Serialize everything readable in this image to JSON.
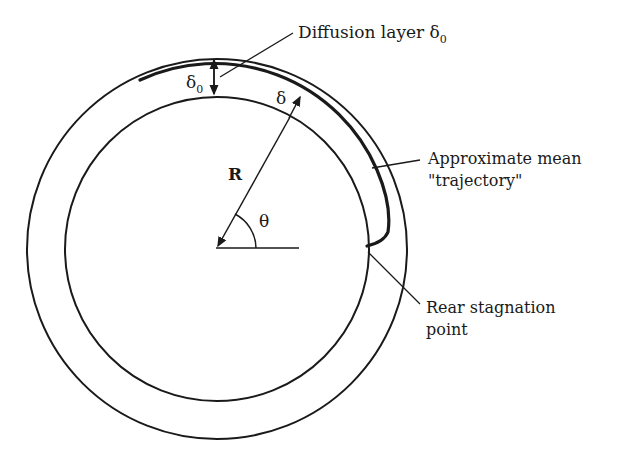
{
  "diagram": {
    "labels": {
      "diffusion_layer": "Diffusion layer δ",
      "diffusion_layer_sub": "0",
      "mean_trajectory_line1": "Approximate mean",
      "mean_trajectory_line2": "\"trajectory\"",
      "rear_stagnation_line1": "Rear stagnation",
      "rear_stagnation_line2": "point",
      "delta0_symbol": "δ",
      "delta0_sub": "0",
      "delta_symbol": "δ",
      "radius_symbol": "R",
      "angle_symbol": "θ"
    },
    "colors": {
      "stroke": "#1a1a1a",
      "background": "#ffffff"
    }
  }
}
